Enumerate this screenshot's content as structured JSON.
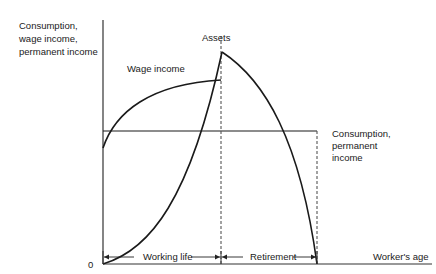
{
  "diagram": {
    "y_axis_label": [
      "Consumption,",
      "wage income,",
      "permanent income"
    ],
    "x_axis_label": "Worker's age",
    "origin_label": "0",
    "curves": {
      "assets": {
        "label": "Assets"
      },
      "wage_income": {
        "label": "Wage income"
      },
      "consumption": {
        "label": [
          "Consumption,",
          "permanent",
          "income"
        ]
      }
    },
    "periods": {
      "working_life": "Working life",
      "retirement": "Retirement"
    },
    "colors": {
      "line": "#1a1a1a",
      "background": "#ffffff"
    }
  }
}
